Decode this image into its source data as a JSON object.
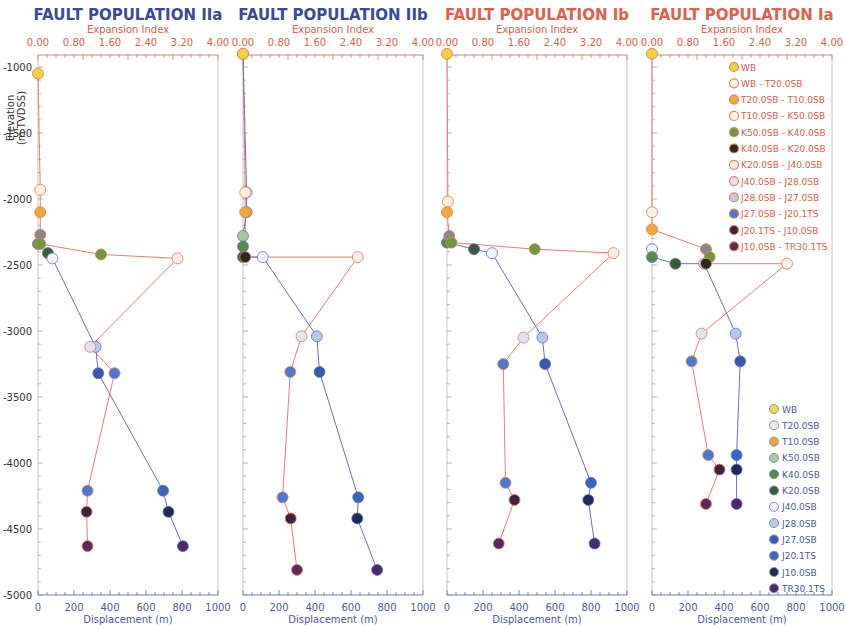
{
  "colors": {
    "blue_title": "#3a4a9a",
    "red_title": "#e0604a",
    "expansion_axis": "#e0604a",
    "displacement_axis": "#4a5aa8",
    "expansion_line": "#e8806a",
    "displacement_line": "#6a74b8",
    "frame": "#c8c8d0"
  },
  "ylabel": "Elevation\n(m TVDSS)",
  "ylabel_line1": "Elevation",
  "ylabel_line2": "(m TVDSS)",
  "yticks": [
    "-1000",
    "-1500",
    "-2000",
    "-2500",
    "-3000",
    "-3500",
    "-4000",
    "-4500",
    "-5000"
  ],
  "top_axis_label": "Expansion Index",
  "top_ticks": [
    "0.00",
    "0.80",
    "1.60",
    "2.40",
    "3.20",
    "4.00"
  ],
  "bottom_axis_label": "Displacement (m)",
  "bottom_ticks": [
    "0",
    "200",
    "400",
    "600",
    "800",
    "1000"
  ],
  "legend_expansion": [
    {
      "label": "WB",
      "color": "#f2d23a",
      "hollow": false
    },
    {
      "label": "WB - T20.0SB",
      "color": "#fff4e0",
      "hollow": true
    },
    {
      "label": "T20.0SB - T10.0SB",
      "color": "#f0a83a",
      "hollow": false
    },
    {
      "label": "T10.0SB -  K50.0SB",
      "color": "#fff6ea",
      "hollow": true
    },
    {
      "label": "K50.0SB - K40.0SB",
      "color": "#6a9a3a",
      "hollow": false
    },
    {
      "label": "K40.0SB - K20.0SB",
      "color": "#2a2a1a",
      "hollow": false
    },
    {
      "label": "K20.0SB - J40.0SB",
      "color": "#fff0ea",
      "hollow": true
    },
    {
      "label": "J40.0SB - J28.0SB",
      "color": "#dde4f4",
      "hollow": false
    },
    {
      "label": "J28.0SB - J27.0SB",
      "color": "#c0cae8",
      "hollow": false
    },
    {
      "label": "J27.0SB - J20.1TS",
      "color": "#4a7ad0",
      "hollow": false
    },
    {
      "label": "J20.1TS - J10.0SB",
      "color": "#3a2440",
      "hollow": false
    },
    {
      "label": "J10.0SB - TR30.1TS",
      "color": "#5a2a5a",
      "hollow": false
    }
  ],
  "legend_displacement": [
    {
      "label": "WB",
      "color": "#e8e040"
    },
    {
      "label": "T20.0SB",
      "color": "#f4ecd8"
    },
    {
      "label": "T10.0SB",
      "color": "#e8a838"
    },
    {
      "label": "K50.0SB",
      "color": "#a8c8a0"
    },
    {
      "label": "K40.0SB",
      "color": "#5a8a4a"
    },
    {
      "label": "K20.0SB",
      "color": "#3a5a3a"
    },
    {
      "label": "J40.0SB",
      "color": "#f0f4fc"
    },
    {
      "label": "J28.0SB",
      "color": "#b8c8ec"
    },
    {
      "label": "J27.0SB",
      "color": "#3a58b0"
    },
    {
      "label": "J20.1TS",
      "color": "#3a64c0"
    },
    {
      "label": "J10.0SB",
      "color": "#1e2a5a"
    },
    {
      "label": "TR30.1TS",
      "color": "#4a2a6a"
    }
  ],
  "chart_data": [
    {
      "type": "line",
      "title": "FAULT POPULATION IIa",
      "title_color": "#3a4a9a",
      "ylabel": "Elevation (m TVDSS)",
      "ylim": [
        -5000,
        -1000
      ],
      "x_bottom": {
        "label": "Displacement (m)",
        "lim": [
          0,
          1000
        ]
      },
      "x_top": {
        "label": "Expansion Index",
        "lim": [
          0,
          4
        ]
      },
      "series": [
        {
          "name": "Expansion Index",
          "axis": "top",
          "points": [
            {
              "ei": 0.0,
              "elev": -1050,
              "horizon": "WB"
            },
            {
              "ei": 0.05,
              "elev": -1930,
              "horizon": "WB - T20.0SB"
            },
            {
              "ei": 0.05,
              "elev": -2100,
              "horizon": "T20.0SB - T10.0SB"
            },
            {
              "ei": 0.05,
              "elev": -2270,
              "horizon": "T10.0SB - K50.0SB"
            },
            {
              "ei": 0.05,
              "elev": -2340,
              "horizon": "K50.0SB - K40.0SB"
            },
            {
              "ei": 1.4,
              "elev": -2420,
              "horizon": "K50.0SB - K40.0SB"
            },
            {
              "ei": 3.1,
              "elev": -2450,
              "horizon": "K20.0SB - J40.0SB"
            },
            {
              "ei": 1.16,
              "elev": -3120,
              "horizon": "J40.0SB - J28.0SB"
            },
            {
              "ei": 1.7,
              "elev": -3320,
              "horizon": "J27.0SB - J20.1TS"
            },
            {
              "ei": 1.1,
              "elev": -4210,
              "horizon": "J27.0SB - J20.1TS"
            },
            {
              "ei": 1.08,
              "elev": -4370,
              "horizon": "J20.1TS - J10.0SB"
            },
            {
              "ei": 1.1,
              "elev": -4630,
              "horizon": "J10.0SB - TR30.1TS"
            }
          ]
        },
        {
          "name": "Displacement",
          "axis": "bottom",
          "points": [
            {
              "disp": 0,
              "elev": -2340,
              "horizon": "K40.0SB"
            },
            {
              "disp": 55,
              "elev": -2410,
              "horizon": "K20.0SB"
            },
            {
              "disp": 80,
              "elev": -2450,
              "horizon": "J40.0SB"
            },
            {
              "disp": 320,
              "elev": -3120,
              "horizon": "J28.0SB"
            },
            {
              "disp": 335,
              "elev": -3320,
              "horizon": "J27.0SB"
            },
            {
              "disp": 695,
              "elev": -4210,
              "horizon": "J20.1TS"
            },
            {
              "disp": 725,
              "elev": -4370,
              "horizon": "J10.0SB"
            },
            {
              "disp": 805,
              "elev": -4630,
              "horizon": "TR30.1TS"
            }
          ]
        }
      ]
    },
    {
      "type": "line",
      "title": "FAULT POPULATION IIb",
      "title_color": "#3a4a9a",
      "ylabel": "Elevation (m TVDSS)",
      "ylim": [
        -5000,
        -1000
      ],
      "x_bottom": {
        "label": "Displacement (m)",
        "lim": [
          0,
          1000
        ]
      },
      "x_top": {
        "label": "Expansion Index",
        "lim": [
          0,
          4
        ]
      },
      "series": [
        {
          "name": "Expansion Index",
          "axis": "top",
          "points": [
            {
              "ei": 0.0,
              "elev": -900,
              "horizon": "WB"
            },
            {
              "ei": 0.05,
              "elev": -1950,
              "horizon": "WB - T20.0SB"
            },
            {
              "ei": 0.05,
              "elev": -2100,
              "horizon": "T20.0SB - T10.0SB"
            },
            {
              "ei": 0.05,
              "elev": -2440,
              "horizon": "K40.0SB - K20.0SB"
            },
            {
              "ei": 2.55,
              "elev": -2440,
              "horizon": "K20.0SB - J40.0SB"
            },
            {
              "ei": 1.3,
              "elev": -3040,
              "horizon": "J40.0SB - J28.0SB"
            },
            {
              "ei": 1.05,
              "elev": -3310,
              "horizon": "J27.0SB - J20.1TS"
            },
            {
              "ei": 0.88,
              "elev": -4260,
              "horizon": "J27.0SB - J20.1TS"
            },
            {
              "ei": 1.06,
              "elev": -4420,
              "horizon": "J20.1TS - J10.0SB"
            },
            {
              "ei": 1.2,
              "elev": -4810,
              "horizon": "J10.0SB - TR30.1TS"
            }
          ]
        },
        {
          "name": "Displacement",
          "axis": "bottom",
          "points": [
            {
              "disp": 0,
              "elev": -900,
              "horizon": "WB"
            },
            {
              "disp": 20,
              "elev": -1950,
              "horizon": "T20.0SB"
            },
            {
              "disp": 20,
              "elev": -2100,
              "horizon": "T10.0SB"
            },
            {
              "disp": 0,
              "elev": -2280,
              "horizon": "K50.0SB"
            },
            {
              "disp": 0,
              "elev": -2360,
              "horizon": "K40.0SB"
            },
            {
              "disp": 0,
              "elev": -2440,
              "horizon": "K20.0SB"
            },
            {
              "disp": 110,
              "elev": -2440,
              "horizon": "J40.0SB"
            },
            {
              "disp": 410,
              "elev": -3040,
              "horizon": "J28.0SB"
            },
            {
              "disp": 425,
              "elev": -3310,
              "horizon": "J27.0SB"
            },
            {
              "disp": 640,
              "elev": -4260,
              "horizon": "J20.1TS"
            },
            {
              "disp": 635,
              "elev": -4420,
              "horizon": "J10.0SB"
            },
            {
              "disp": 745,
              "elev": -4810,
              "horizon": "TR30.1TS"
            }
          ]
        }
      ]
    },
    {
      "type": "line",
      "title": "FAULT POPULATION Ib",
      "title_color": "#e0604a",
      "ylabel": "Elevation (m TVDSS)",
      "ylim": [
        -5000,
        -1000
      ],
      "x_bottom": {
        "label": "Displacement (m)",
        "lim": [
          0,
          1000
        ]
      },
      "x_top": {
        "label": "Expansion Index",
        "lim": [
          0,
          4
        ]
      },
      "series": [
        {
          "name": "Expansion Index",
          "axis": "top",
          "points": [
            {
              "ei": 0.0,
              "elev": -900,
              "horizon": "WB"
            },
            {
              "ei": 0.02,
              "elev": -2020,
              "horizon": "WB - T20.0SB"
            },
            {
              "ei": 0.0,
              "elev": -2100,
              "horizon": "T20.0SB - T10.0SB"
            },
            {
              "ei": 0.05,
              "elev": -2280,
              "horizon": "T10.0SB - K50.0SB"
            },
            {
              "ei": 0.1,
              "elev": -2330,
              "horizon": "K50.0SB - K40.0SB"
            },
            {
              "ei": 1.95,
              "elev": -2380,
              "horizon": "K50.0SB - K40.0SB"
            },
            {
              "ei": 3.7,
              "elev": -2410,
              "horizon": "K20.0SB - J40.0SB"
            },
            {
              "ei": 1.7,
              "elev": -3050,
              "horizon": "J40.0SB - J28.0SB"
            },
            {
              "ei": 1.25,
              "elev": -3250,
              "horizon": "J27.0SB - J20.1TS"
            },
            {
              "ei": 1.3,
              "elev": -4150,
              "horizon": "J27.0SB - J20.1TS"
            },
            {
              "ei": 1.5,
              "elev": -4280,
              "horizon": "J20.1TS - J10.0SB"
            },
            {
              "ei": 1.15,
              "elev": -4610,
              "horizon": "J10.0SB - TR30.1TS"
            }
          ]
        },
        {
          "name": "Displacement",
          "axis": "bottom",
          "points": [
            {
              "disp": 0,
              "elev": -2330,
              "horizon": "K40.0SB"
            },
            {
              "disp": 150,
              "elev": -2380,
              "horizon": "K20.0SB"
            },
            {
              "disp": 250,
              "elev": -2410,
              "horizon": "J40.0SB"
            },
            {
              "disp": 530,
              "elev": -3050,
              "horizon": "J28.0SB"
            },
            {
              "disp": 545,
              "elev": -3250,
              "horizon": "J27.0SB"
            },
            {
              "disp": 800,
              "elev": -4150,
              "horizon": "J20.1TS"
            },
            {
              "disp": 785,
              "elev": -4280,
              "horizon": "J10.0SB"
            },
            {
              "disp": 820,
              "elev": -4610,
              "horizon": "TR30.1TS"
            }
          ]
        }
      ]
    },
    {
      "type": "line",
      "title": "FAULT POPULATION Ia",
      "title_color": "#e0604a",
      "ylabel": "Elevation (m TVDSS)",
      "ylim": [
        -5000,
        -1000
      ],
      "x_bottom": {
        "label": "Displacement (m)",
        "lim": [
          0,
          1000
        ]
      },
      "x_top": {
        "label": "Expansion Index",
        "lim": [
          0,
          4
        ]
      },
      "series": [
        {
          "name": "Expansion Index",
          "axis": "top",
          "points": [
            {
              "ei": 0.0,
              "elev": -900,
              "horizon": "WB"
            },
            {
              "ei": 0.0,
              "elev": -2100,
              "horizon": "WB - T20.0SB"
            },
            {
              "ei": 0.0,
              "elev": -2230,
              "horizon": "T20.0SB - T10.0SB"
            },
            {
              "ei": 1.2,
              "elev": -2380,
              "horizon": "T10.0SB - K50.0SB"
            },
            {
              "ei": 1.28,
              "elev": -2440,
              "horizon": "K50.0SB - K40.0SB"
            },
            {
              "ei": 1.2,
              "elev": -2490,
              "horizon": "K40.0SB - K20.0SB"
            },
            {
              "ei": 3.0,
              "elev": -2490,
              "horizon": "K20.0SB - J40.0SB"
            },
            {
              "ei": 1.1,
              "elev": -3020,
              "horizon": "J40.0SB - J28.0SB"
            },
            {
              "ei": 0.88,
              "elev": -3230,
              "horizon": "J27.0SB - J20.1TS"
            },
            {
              "ei": 1.25,
              "elev": -3940,
              "horizon": "J27.0SB - J20.1TS"
            },
            {
              "ei": 1.5,
              "elev": -4050,
              "horizon": "J20.1TS - J10.0SB"
            },
            {
              "ei": 1.2,
              "elev": -4310,
              "horizon": "J10.0SB - TR30.1TS"
            }
          ]
        },
        {
          "name": "Displacement",
          "axis": "bottom",
          "points": [
            {
              "disp": 0,
              "elev": -2380,
              "horizon": "J40.0SB"
            },
            {
              "disp": 0,
              "elev": -2440,
              "horizon": "K40.0SB"
            },
            {
              "disp": 130,
              "elev": -2490,
              "horizon": "K20.0SB"
            },
            {
              "disp": 290,
              "elev": -2490,
              "horizon": "J40.0SB"
            },
            {
              "disp": 465,
              "elev": -3020,
              "horizon": "J28.0SB"
            },
            {
              "disp": 490,
              "elev": -3230,
              "horizon": "J27.0SB"
            },
            {
              "disp": 470,
              "elev": -3940,
              "horizon": "J20.1TS"
            },
            {
              "disp": 470,
              "elev": -4050,
              "horizon": "J10.0SB"
            },
            {
              "disp": 470,
              "elev": -4310,
              "horizon": "TR30.1TS"
            }
          ]
        }
      ]
    }
  ]
}
